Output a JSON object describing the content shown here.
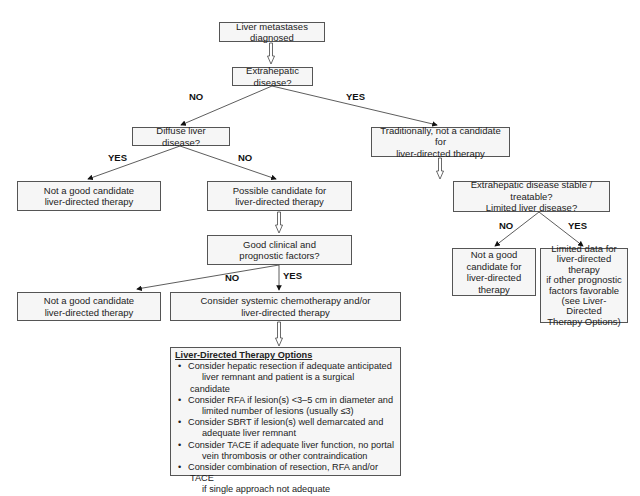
{
  "flowchart": {
    "nodes": {
      "start": "Liver metastases diagnosed",
      "extrahepatic_q": "Extrahepatic disease?",
      "diffuse_q": "Diffuse liver disease?",
      "traditionally": [
        "Traditionally, not a candidate for",
        "liver-directed therapy"
      ],
      "not_good_1": [
        "Not a good candidate",
        "liver-directed therapy"
      ],
      "possible_candidate": [
        "Possible candidate for",
        "liver-directed therapy"
      ],
      "good_factors_q": [
        "Good clinical and",
        "prognostic factors?"
      ],
      "not_good_2": [
        "Not a good candidate",
        "liver-directed therapy"
      ],
      "consider_systemic": [
        "Consider systemic chemotherapy and/or",
        "liver-directed therapy"
      ],
      "stable_q": [
        "Extrahepatic disease stable / treatable?",
        "Limited liver disease?"
      ],
      "not_good_3": [
        "Not a good",
        "candidate for",
        "liver-directed",
        "therapy"
      ],
      "limited_data": [
        "Limited data for",
        "liver-directed",
        "therapy",
        "if other prognostic",
        "factors favorable",
        "(see Liver-Directed",
        "Therapy Options)"
      ]
    },
    "edge_labels": {
      "extrahepatic_no": "NO",
      "extrahepatic_yes": "YES",
      "diffuse_yes": "YES",
      "diffuse_no": "NO",
      "factors_no": "NO",
      "factors_yes": "YES",
      "stable_no": "NO",
      "stable_yes": "YES"
    },
    "options": {
      "title": "Liver-Directed Therapy Options",
      "items": [
        [
          "Consider hepatic resection if adequate anticipated",
          "liver remnant and patient is a surgical candidate"
        ],
        [
          "Consider RFA if lesion(s) <3–5 cm in diameter and",
          "limited number of lesions (usually ≤3)"
        ],
        [
          "Consider SBRT if lesion(s) well demarcated and",
          "adequate liver remnant"
        ],
        [
          "Consider TACE if adequate liver function, no portal",
          "vein thrombosis or other contraindication"
        ],
        [
          "Consider combination of resection, RFA and/or TACE",
          "if single approach not adequate"
        ]
      ],
      "bullet": "•"
    }
  }
}
